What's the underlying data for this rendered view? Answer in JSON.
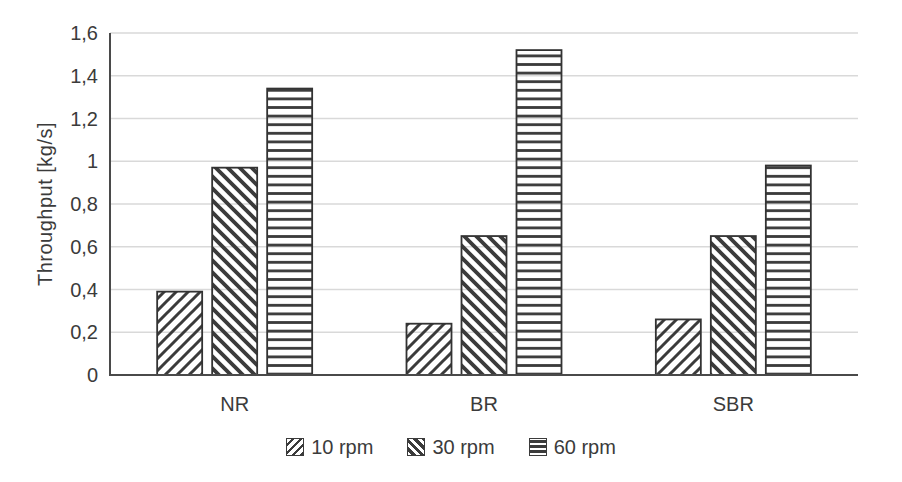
{
  "chart_data": {
    "type": "bar",
    "title": "",
    "categories": [
      "NR",
      "BR",
      "SBR"
    ],
    "series": [
      {
        "name": "10 rpm",
        "hatch": "diagonal-up",
        "values": [
          0.39,
          0.24,
          0.26
        ]
      },
      {
        "name": "30 rpm",
        "hatch": "diagonal-down",
        "values": [
          0.97,
          0.65,
          0.65
        ]
      },
      {
        "name": "60 rpm",
        "hatch": "horizontal",
        "values": [
          1.34,
          1.52,
          0.98
        ]
      }
    ],
    "xlabel": "",
    "ylabel": "Throughput [kg/s]",
    "ylim": [
      0,
      1.6
    ],
    "ytick_step": 0.2,
    "ytick_labels": [
      "0",
      "0,2",
      "0,4",
      "0,6",
      "0,8",
      "1",
      "1,2",
      "1,4",
      "1,6"
    ],
    "decimal_separator": ",",
    "grid": true,
    "legend_position": "bottom-center",
    "legend_entries": [
      "10 rpm",
      "30 rpm",
      "60 rpm"
    ]
  },
  "colors": {
    "background": "#ffffff",
    "ink": "#3b3b3b",
    "bar_border": "#333333",
    "bar_fill": "#ffffff",
    "gridline": "#d9d9d9",
    "axis": "#4a4a4a"
  }
}
